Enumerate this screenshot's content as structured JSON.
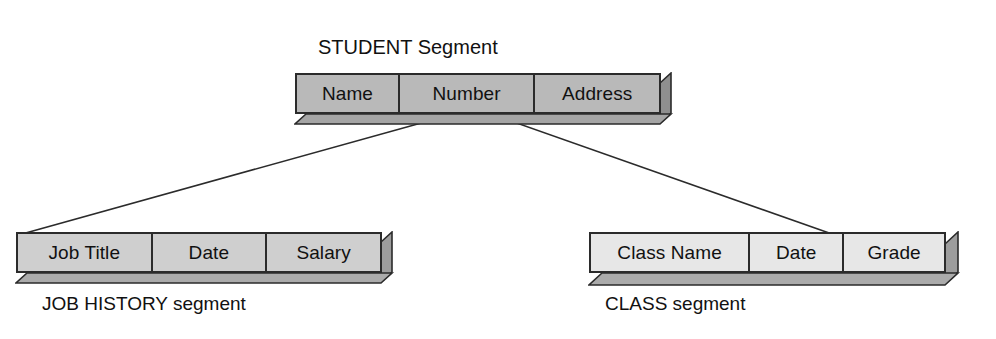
{
  "diagram": {
    "background_color": "#ffffff",
    "line_color": "#2b2b2b",
    "text_color": "#111111"
  },
  "nodes": {
    "student": {
      "title": "STUDENT Segment",
      "fill": "#b9b9b9",
      "side_fill": "#8f8f8f",
      "bottom_fill": "#a5a5a5",
      "cells": [
        {
          "label": "Name"
        },
        {
          "label": "Number"
        },
        {
          "label": "Address"
        }
      ]
    },
    "job_history": {
      "caption": "JOB HISTORY segment",
      "fill": "#cfcfcf",
      "side_fill": "#9d9d9d",
      "bottom_fill": "#ababab",
      "cells": [
        {
          "label": "Job Title"
        },
        {
          "label": "Date"
        },
        {
          "label": "Salary"
        }
      ]
    },
    "class": {
      "caption": "CLASS segment",
      "fill": "#e7e7e7",
      "side_fill": "#9d9d9d",
      "bottom_fill": "#ababab",
      "cells": [
        {
          "label": "Class Name"
        },
        {
          "label": "Date"
        },
        {
          "label": "Grade"
        }
      ]
    }
  },
  "connectors": [
    {
      "name": "student-to-job-history",
      "from": "student",
      "to": "job_history",
      "has_tick": true
    },
    {
      "name": "student-to-class",
      "from": "student",
      "to": "class",
      "has_tick": true
    }
  ]
}
